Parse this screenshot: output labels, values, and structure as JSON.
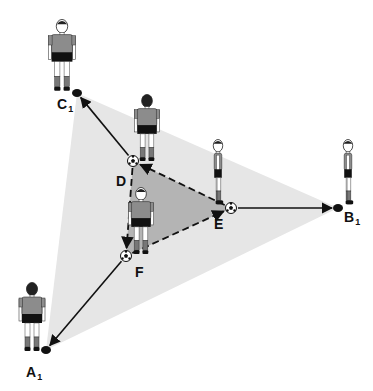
{
  "diagram": {
    "type": "soccer passing drill",
    "colors": {
      "outer_triangle": "#e6e6e6",
      "inner_triangle": "#b4b4b4",
      "jersey": "#8c8c8c",
      "shorts": "#111111",
      "line": "#111111"
    },
    "outer_triangle": {
      "points": [
        [
          77,
          93
        ],
        [
          338,
          208
        ],
        [
          46,
          350
        ]
      ]
    },
    "inner_triangle": {
      "points": [
        [
          133,
          161
        ],
        [
          231,
          208
        ],
        [
          126,
          256
        ]
      ]
    },
    "cones": [
      {
        "id": "C1",
        "x": 77,
        "y": 93
      },
      {
        "id": "B1",
        "x": 338,
        "y": 208
      },
      {
        "id": "A1",
        "x": 46,
        "y": 350
      }
    ],
    "balls": [
      {
        "id": "D",
        "x": 133,
        "y": 161
      },
      {
        "id": "E",
        "x": 231,
        "y": 208
      },
      {
        "id": "F",
        "x": 126,
        "y": 256
      }
    ],
    "labels": [
      {
        "key": "C1",
        "base": "C",
        "sub": "1",
        "x": 57,
        "y": 109
      },
      {
        "key": "B1",
        "base": "B",
        "sub": "1",
        "x": 344,
        "y": 222
      },
      {
        "key": "A1",
        "base": "A",
        "sub": "1",
        "x": 26,
        "y": 377
      },
      {
        "key": "D",
        "base": "D",
        "sub": "",
        "x": 116,
        "y": 186
      },
      {
        "key": "E",
        "base": "E",
        "sub": "",
        "x": 214,
        "y": 229
      },
      {
        "key": "F",
        "base": "F",
        "sub": "",
        "x": 135,
        "y": 277
      }
    ],
    "solid_passes": [
      {
        "from": "D",
        "to": "C1"
      },
      {
        "from": "E",
        "to": "B1"
      },
      {
        "from": "F",
        "to": "A1"
      }
    ],
    "dashed_runs": [
      {
        "from": "D",
        "to": "F"
      },
      {
        "from": "F",
        "to": "E"
      },
      {
        "from": "E",
        "to": "D"
      }
    ],
    "players": [
      {
        "id": "player-C",
        "x": 62,
        "y": 20,
        "view": "front",
        "height": 75
      },
      {
        "id": "player-D",
        "x": 147,
        "y": 95,
        "view": "back",
        "height": 70
      },
      {
        "id": "player-E",
        "x": 218,
        "y": 140,
        "view": "side",
        "height": 68
      },
      {
        "id": "player-B",
        "x": 348,
        "y": 140,
        "view": "side",
        "height": 68
      },
      {
        "id": "player-F",
        "x": 141,
        "y": 188,
        "view": "front",
        "height": 70
      },
      {
        "id": "player-A",
        "x": 32,
        "y": 283,
        "view": "back",
        "height": 72
      }
    ]
  }
}
